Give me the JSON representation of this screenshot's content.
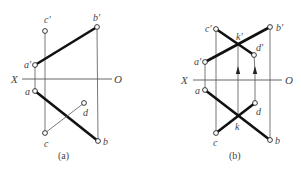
{
  "figure_a": {
    "caption": "(a)",
    "axis": {
      "x_label": "X",
      "o_label": "O",
      "y": 79,
      "x1": 22,
      "x2": 112
    },
    "points": {
      "a_prime": {
        "label": "a′",
        "x": 35,
        "y": 65
      },
      "b_prime": {
        "label": "b′",
        "x": 97,
        "y": 27
      },
      "c_prime": {
        "label": "c′",
        "x": 45,
        "y": 31
      },
      "a": {
        "label": "a",
        "x": 35,
        "y": 91
      },
      "b": {
        "label": "b",
        "x": 98,
        "y": 141
      },
      "c": {
        "label": "c",
        "x": 45,
        "y": 133
      },
      "d": {
        "label": "d",
        "x": 84,
        "y": 103
      }
    }
  },
  "figure_b": {
    "caption": "(b)",
    "axis": {
      "x_label": "X",
      "o_label": "O",
      "y": 80,
      "x1": 193,
      "x2": 282
    },
    "points": {
      "a_prime": {
        "label": "a′",
        "x": 205,
        "y": 62
      },
      "b_prime": {
        "label": "b′",
        "x": 270,
        "y": 27
      },
      "c_prime": {
        "label": "c′",
        "x": 216,
        "y": 29
      },
      "d_prime": {
        "label": "d′",
        "x": 254,
        "y": 55
      },
      "k_prime": {
        "label": "k′",
        "x": 238,
        "y": 45
      },
      "a": {
        "label": "a",
        "x": 205,
        "y": 90
      },
      "b": {
        "label": "b",
        "x": 270,
        "y": 140
      },
      "c": {
        "label": "c",
        "x": 216,
        "y": 133
      },
      "d": {
        "label": "d",
        "x": 255,
        "y": 103
      },
      "k": {
        "label": "k",
        "x": 238,
        "y": 116
      }
    }
  }
}
